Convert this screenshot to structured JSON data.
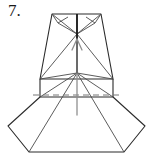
{
  "figure": {
    "step_label": "7.",
    "caption": "",
    "colors": {
      "background": "#ffffff",
      "outline": "#2b2b2b",
      "crease": "#555555",
      "dashed_crease": "#777777",
      "arrow": "#8a8a8a",
      "label_text": "#1a1a1a"
    },
    "stroke_widths": {
      "outline": 1.1,
      "crease": 0.9,
      "dashed": 1.0,
      "arrow": 1.3,
      "center_spine": 1.9
    },
    "dash_pattern": "6,4",
    "geometry": {
      "viewbox": "0 0 153 166",
      "outline_paths": [
        "M 52 14 L 101 14 L 113 79 L 40 79 Z",
        "M 40 79 L 40 97 L 113 97 L 113 79",
        "M 40 97 L 8 126 L 29 152 L 124 152 L 145 126 L 113 97 Z"
      ],
      "crease_lines": [
        "M 52 14 L 77 34",
        "M 101 14 L 77 34",
        "M 52 14 L 60 22 L 77 34 L 64 28 Z",
        "M 101 14 L 93 22 L 77 34 L 89 28 Z",
        "M 77 14 L 77 34",
        "M 77 34 L 40 79",
        "M 77 34 L 113 79",
        "M 40 79 L 77 73",
        "M 113 79 L 77 73",
        "M 77 73 L 40 97",
        "M 77 73 L 113 97",
        "M 77 73 L 29 152",
        "M 77 73 L 124 152"
      ],
      "spine": "M 77 14 L 77 73",
      "dashed_lines": [
        "M 33 95 L 120 95"
      ],
      "arrow": {
        "shaft": "M 77 115 L 77 40",
        "head_left": "M 71 50 L 77 38",
        "head_right": "M 83 50 L 77 38",
        "direction": "up"
      }
    }
  }
}
